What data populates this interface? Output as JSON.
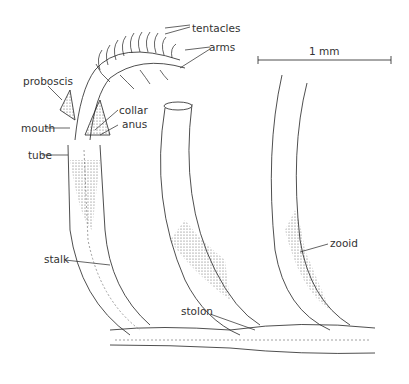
{
  "figure": {
    "labels": {
      "tentacles": "tentacles",
      "arms": "arms",
      "proboscis": "proboscis",
      "collar": "collar",
      "mouth": "mouth",
      "anus": "anus",
      "tube": "tube",
      "stalk": "stalk",
      "stolon": "stolon",
      "zooid": "zooid"
    },
    "scale_bar": {
      "label": "1 mm"
    }
  }
}
